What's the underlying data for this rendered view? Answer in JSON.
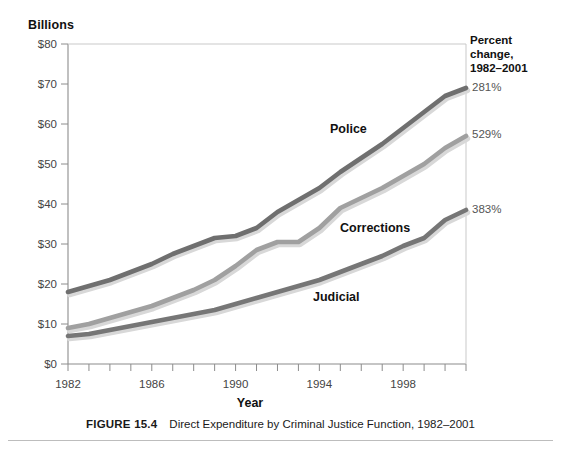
{
  "figure": {
    "caption_number": "FIGURE 15.4",
    "caption_text": "Direct Expenditure by Criminal Justice Function, 1982–2001"
  },
  "axis": {
    "y_unit_label": "Billions",
    "x_title": "Year"
  },
  "percent_panel": {
    "header_line1": "Percent",
    "header_line2": "change,",
    "header_line3": "1982–2001",
    "police": "281%",
    "corrections": "529%",
    "judicial": "383%"
  },
  "series_labels": {
    "police": "Police",
    "corrections": "Corrections",
    "judicial": "Judicial"
  },
  "colors": {
    "police_line": "#6f6f6f",
    "corrections_line": "#a0a0a0",
    "judicial_line": "#767676",
    "axis": "#8c8c8c",
    "text": "#1a1a1a",
    "tick_text": "#444444",
    "rule": "#bdbdbd",
    "background": "#ffffff"
  },
  "chart_data": {
    "type": "line",
    "title": "Direct Expenditure by Criminal Justice Function, 1982–2001",
    "xlabel": "Year",
    "ylabel": "Billions",
    "xlim": [
      1982,
      2001
    ],
    "ylim": [
      0,
      80
    ],
    "ytick_values": [
      0,
      10,
      20,
      30,
      40,
      50,
      60,
      70,
      80
    ],
    "ytick_labels": [
      "$0",
      "$10",
      "$20",
      "$30",
      "$40",
      "$50",
      "$60",
      "$70",
      "$80"
    ],
    "xtick_values": [
      1982,
      1983,
      1984,
      1985,
      1986,
      1987,
      1988,
      1989,
      1990,
      1991,
      1992,
      1993,
      1994,
      1995,
      1996,
      1997,
      1998,
      1999,
      2000,
      2001
    ],
    "xtick_labels_shown": [
      "1982",
      "1986",
      "1990",
      "1994",
      "1998"
    ],
    "xtick_labels_shown_values": [
      1982,
      1986,
      1990,
      1994,
      1998
    ],
    "grid": false,
    "legend": "inline-series-labels",
    "x": [
      1982,
      1983,
      1984,
      1985,
      1986,
      1987,
      1988,
      1989,
      1990,
      1991,
      1992,
      1993,
      1994,
      1995,
      1996,
      1997,
      1998,
      1999,
      2000,
      2001
    ],
    "series": [
      {
        "name": "Police",
        "color": "#6f6f6f",
        "percent_change_1982_2001": "281%",
        "values": [
          18.0,
          19.5,
          21.0,
          23.0,
          25.0,
          27.5,
          29.5,
          31.5,
          32.0,
          34.0,
          38.0,
          41.0,
          44.0,
          48.0,
          51.5,
          55.0,
          59.0,
          63.0,
          67.0,
          69.0
        ]
      },
      {
        "name": "Corrections",
        "color": "#a0a0a0",
        "percent_change_1982_2001": "529%",
        "values": [
          9.0,
          10.0,
          11.5,
          13.0,
          14.5,
          16.5,
          18.5,
          21.0,
          24.5,
          28.5,
          30.5,
          30.5,
          34.0,
          39.0,
          41.5,
          44.0,
          47.0,
          50.0,
          54.0,
          57.0
        ]
      },
      {
        "name": "Judicial",
        "color": "#767676",
        "percent_change_1982_2001": "383%",
        "values": [
          7.0,
          7.5,
          8.5,
          9.5,
          10.5,
          11.5,
          12.5,
          13.5,
          15.0,
          16.5,
          18.0,
          19.5,
          21.0,
          23.0,
          25.0,
          27.0,
          29.5,
          31.5,
          36.0,
          38.5
        ]
      }
    ]
  }
}
